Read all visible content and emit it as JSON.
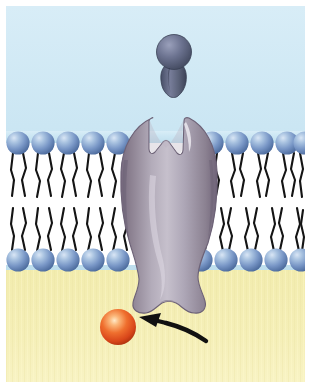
{
  "figure": {
    "title": "Ligand binding to a transmembrane receptor protein"
  },
  "canvas": {
    "width": 310,
    "height": 387,
    "margin_left": 6,
    "margin_top": 6,
    "margin_right": 5,
    "margin_bottom": 5,
    "background": "#ffffff"
  },
  "regions": {
    "extracellular": {
      "label": "extracellular space",
      "color_top": "#cfe7f2",
      "color_bottom": "#c3e0ee",
      "y_start": 6,
      "y_end": 150
    },
    "membrane": {
      "label": "phospholipid bilayer",
      "color": "#ffffff",
      "y_start": 130,
      "y_end": 272
    },
    "cytoplasm": {
      "label": "cytoplasm",
      "color_top": "#f3eeb4",
      "color_bottom": "#f6f0bb",
      "y_start": 270,
      "y_end": 382
    }
  },
  "bilayer": {
    "label": "phospholipid bilayer",
    "head_color_light": "#b9cfe8",
    "head_color_mid": "#7c9ccd",
    "head_color_dark": "#4f6f9e",
    "tail_color": "#1a1a1a",
    "head_radius": 11.5,
    "head_spacing": 25.5,
    "upper_head_cy": 143,
    "lower_head_cy": 260,
    "upper_heads_left": [
      18,
      43.5,
      69,
      94.5,
      120
    ],
    "upper_heads_right": [
      212,
      237.5,
      263,
      288.5,
      302
    ],
    "lower_heads_left": [
      18,
      43.5,
      69,
      94.5,
      120
    ],
    "lower_heads_right": [
      200,
      225.5,
      251,
      276.5,
      300
    ],
    "upper_tail_top": 154,
    "upper_tail_bottom": 196,
    "lower_tail_top": 207,
    "lower_tail_bottom": 249
  },
  "receptor": {
    "label": "transmembrane receptor protein",
    "color_edge": "#7f7287",
    "color_mid": "#9a91a3",
    "color_light": "#c3bcc8",
    "color_shadow": "#6b6174",
    "cleft_label": "ligand binding cleft",
    "center_x": 166,
    "top_y": 112,
    "bottom_y": 310
  },
  "ligand": {
    "label": "ligand (signaling molecule)",
    "color_light": "#8d93ae",
    "color_mid": "#5f657f",
    "color_dark": "#424a63",
    "center_x": 174,
    "head_cy": 52,
    "head_r": 17,
    "tail_bottom_y": 95
  },
  "second_messenger": {
    "label": "second messenger molecule",
    "color_light": "#ffd9a0",
    "color_mid": "#e8612a",
    "color_dark": "#b8350f",
    "cx": 118,
    "cy": 327,
    "r": 18
  },
  "arrow": {
    "label": "response arrow",
    "color": "#111111",
    "from_x": 210,
    "from_y": 340,
    "to_x": 141,
    "to_y": 318
  }
}
